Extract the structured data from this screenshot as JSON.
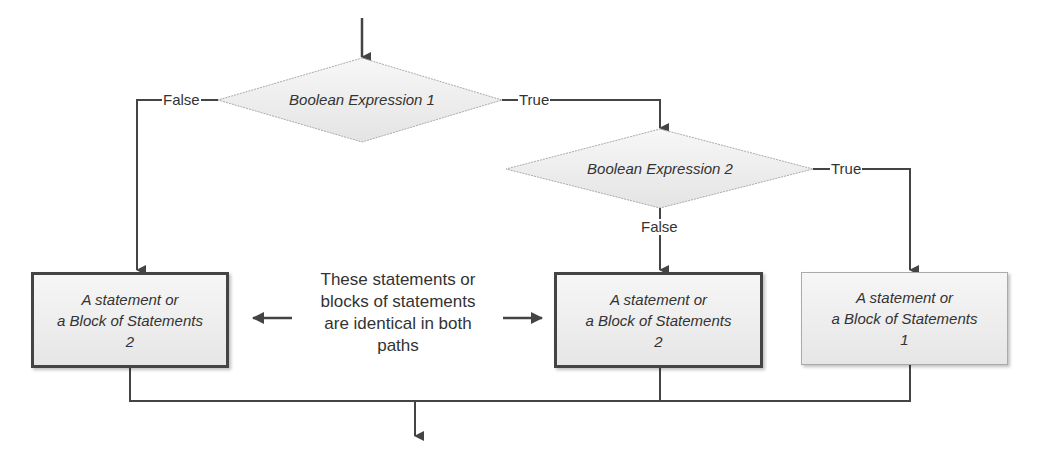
{
  "decisions": [
    {
      "label": "Boolean Expression 1",
      "false_label": "False",
      "true_label": "True"
    },
    {
      "label": "Boolean Expression 2",
      "false_label": "False",
      "true_label": "True"
    }
  ],
  "boxes": [
    {
      "line1": "A statement or",
      "line2": "a Block of Statements",
      "line3": "2"
    },
    {
      "line1": "A statement or",
      "line2": "a Block of Statements",
      "line3": "2"
    },
    {
      "line1": "A statement or",
      "line2": "a Block of Statements",
      "line3": "1"
    }
  ],
  "note": {
    "lines": [
      "These statements or",
      "blocks of statements",
      "are identical in both",
      "paths"
    ]
  },
  "colors": {
    "line": "#444444",
    "fill": "#eeeeee",
    "diamond_border": "#aaaaaa"
  }
}
